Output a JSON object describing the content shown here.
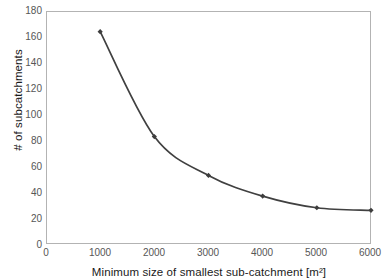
{
  "chart_data": {
    "type": "line",
    "title": "",
    "subtitle": "",
    "xlabel": "Minimum size of smallest sub-catchment [m²]",
    "ylabel": "# of subcatchments",
    "x": [
      1000,
      2000,
      3000,
      4000,
      5000,
      6000
    ],
    "values": [
      164,
      83,
      53,
      37,
      28,
      26
    ],
    "series": [
      {
        "name": "# of subcatchments",
        "values": [
          164,
          83,
          53,
          37,
          28,
          26
        ]
      }
    ],
    "xlim": [
      0,
      6000
    ],
    "ylim": [
      0,
      180
    ],
    "xticks": [
      0,
      1000,
      2000,
      3000,
      4000,
      5000,
      6000
    ],
    "yticks": [
      0,
      20,
      40,
      60,
      80,
      100,
      120,
      140,
      160,
      180
    ],
    "xtick_labels": [
      "0",
      "1000",
      "2000",
      "3000",
      "4000",
      "5000",
      "6000"
    ],
    "ytick_labels": [
      "0",
      "20",
      "40",
      "60",
      "80",
      "100",
      "120",
      "140",
      "160",
      "180"
    ],
    "grid": false,
    "legend": false,
    "legend_position": "none",
    "marker": "diamond",
    "annotations": [],
    "colors": {
      "line": "#404040",
      "marker": "#3d3d3d",
      "plot_border": "#b3b3b3",
      "tick_label": "#565656",
      "axis_title": "#1a1a1a",
      "background": "#ffffff"
    }
  }
}
